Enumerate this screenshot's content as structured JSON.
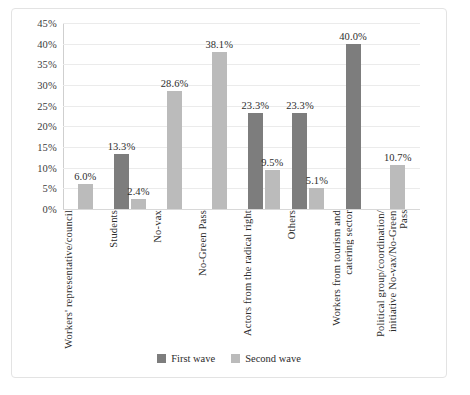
{
  "chart_data": {
    "type": "bar",
    "title": "",
    "xlabel": "",
    "ylabel": "",
    "ylim": [
      0,
      45
    ],
    "ytick_labels": [
      "0%",
      "5%",
      "10%",
      "15%",
      "20%",
      "25%",
      "30%",
      "35%",
      "40%",
      "45%"
    ],
    "ytick_values": [
      0,
      5,
      10,
      15,
      20,
      25,
      30,
      35,
      40,
      45
    ],
    "grid": true,
    "legend_position": "bottom",
    "categories": [
      "Workers' representative/council",
      "Students",
      "No-vax",
      "No-Green Pass",
      "Actors from the radical right",
      "Others",
      "Workers from tourism and\ncatering sector",
      "Political group/coordination/\ninitiative No-vax/No-Green Pass"
    ],
    "series": [
      {
        "name": "First wave",
        "color": "#7d7d7d",
        "values": [
          null,
          13.3,
          null,
          null,
          23.3,
          23.3,
          40.0,
          null
        ],
        "labels": [
          "",
          "13.3%",
          "",
          "",
          "23.3%",
          "23.3%",
          "40.0%",
          ""
        ]
      },
      {
        "name": "Second wave",
        "color": "#bbbbbb",
        "values": [
          6.0,
          2.4,
          28.6,
          38.1,
          9.5,
          5.1,
          null,
          10.7
        ],
        "labels": [
          "6.0%",
          "2.4%",
          "28.6%",
          "38.1%",
          "9.5%",
          "5.1%",
          "",
          "10.7%"
        ]
      }
    ]
  },
  "legend": {
    "items": [
      {
        "label": "First wave"
      },
      {
        "label": "Second wave"
      }
    ]
  }
}
